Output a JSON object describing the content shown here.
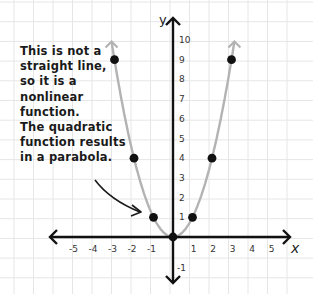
{
  "annotation": {
    "lines": [
      "This is not a",
      "straight line,",
      "so it is a",
      "nonlinear",
      "function.",
      "The quadratic",
      "function results",
      "in a parabola."
    ]
  },
  "axes": {
    "x_label": "x",
    "y_label": "y",
    "x_ticks": [
      "-5",
      "-4",
      "-3",
      "-2",
      "-1",
      "1",
      "2",
      "3",
      "4",
      "5"
    ],
    "y_ticks": [
      "-1",
      "1",
      "2",
      "3",
      "4",
      "5",
      "6",
      "7",
      "8",
      "9",
      "10"
    ]
  },
  "colors": {
    "axis": "#111111",
    "curve": "#b3b3b3",
    "point": "#111111",
    "grid": "#e6e6e6"
  },
  "chart_data": {
    "type": "line",
    "title": "",
    "xlabel": "x",
    "ylabel": "y",
    "function": "y = x^2",
    "x": [
      -3,
      -2,
      -1,
      0,
      1,
      2,
      3
    ],
    "series": [
      {
        "name": "y = x^2",
        "values": [
          9,
          4,
          1,
          0,
          1,
          4,
          9
        ]
      }
    ],
    "xlim": [
      -5,
      5
    ],
    "ylim": [
      -1,
      10
    ],
    "grid": true,
    "annotations": [
      "This is not a straight line, so it is a nonlinear function. The quadratic function results in a parabola."
    ]
  }
}
